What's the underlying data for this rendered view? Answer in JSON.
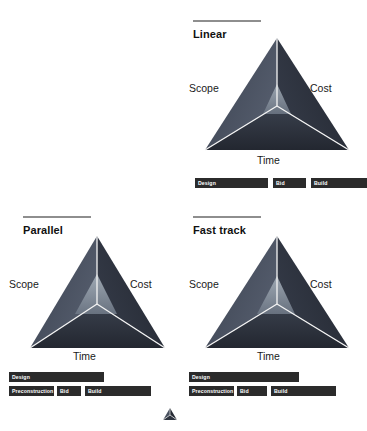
{
  "figure": {
    "background": "#ffffff",
    "accent_rule_color": "#8e8e8e",
    "bar_color": "#2b2b2b",
    "bar_label_color": "#ffffff",
    "triangle_dark": "#2e3442",
    "triangle_mid": "#454c5c",
    "triangle_light": "#6f7a8c",
    "triangle_inner": "#94a0ac",
    "divider_color": "#f2f2f2"
  },
  "panels": [
    {
      "id": "linear",
      "title": "Linear",
      "vertex_labels": {
        "left": "Scope",
        "right": "Cost",
        "bottom": "Time"
      },
      "bar_rows": [
        {
          "row": 1,
          "bars": [
            {
              "label": "Design",
              "x": 10,
              "width": 73
            },
            {
              "label": "Bid",
              "x": 88,
              "width": 33
            },
            {
              "label": "Build",
              "x": 126,
              "width": 56
            }
          ]
        }
      ]
    },
    {
      "id": "parallel",
      "title": "Parallel",
      "vertex_labels": {
        "left": "Scope",
        "right": "Cost",
        "bottom": "Time"
      },
      "bar_rows": [
        {
          "row": 1,
          "bars": [
            {
              "label": "Design",
              "x": 4,
              "width": 95
            }
          ]
        },
        {
          "row": 2,
          "bars": [
            {
              "label": "Preconstruction",
              "x": 4,
              "width": 45
            },
            {
              "label": "Bid",
              "x": 52,
              "width": 24
            },
            {
              "label": "Build",
              "x": 80,
              "width": 66
            }
          ]
        }
      ]
    },
    {
      "id": "fast-track",
      "title": "Fast track",
      "vertex_labels": {
        "left": "Scope",
        "right": "Cost",
        "bottom": "Time"
      },
      "bar_rows": [
        {
          "row": 1,
          "bars": [
            {
              "label": "Design",
              "x": 4,
              "width": 110
            }
          ]
        },
        {
          "row": 2,
          "bars": [
            {
              "label": "Preconstruction",
              "x": 4,
              "width": 45
            },
            {
              "label": "Bid",
              "x": 52,
              "width": 30
            },
            {
              "label": "Build",
              "x": 86,
              "width": 65
            }
          ]
        }
      ]
    }
  ],
  "footer": {
    "icon": "triangle-mark-icon"
  }
}
